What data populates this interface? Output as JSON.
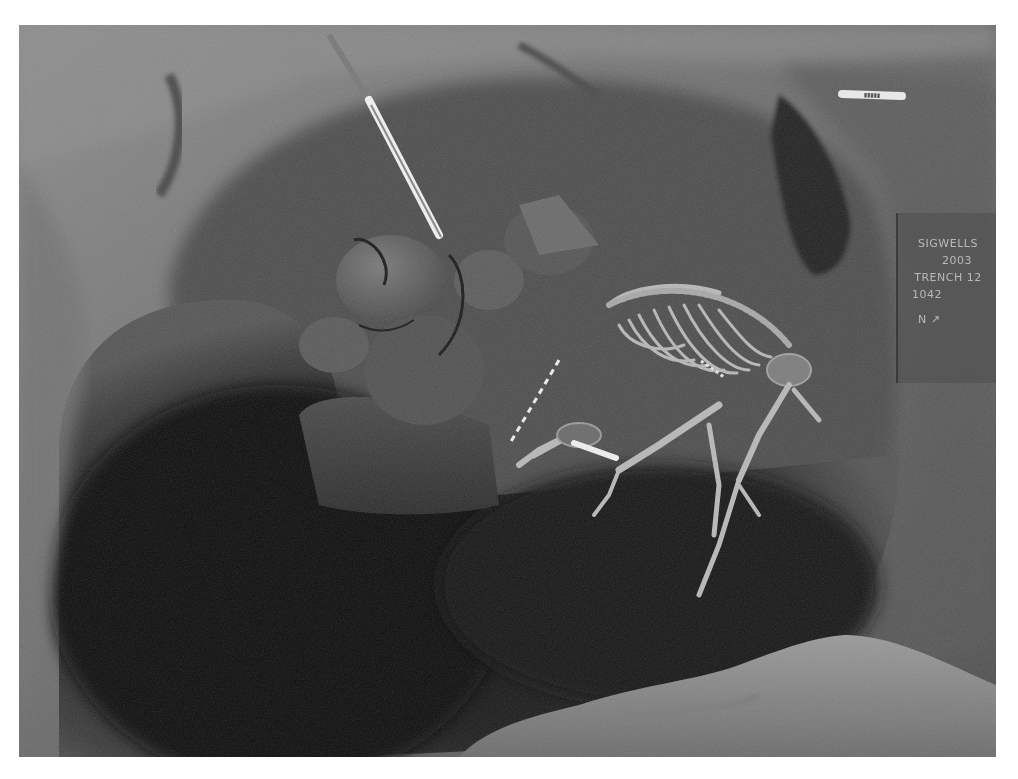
{
  "photo": {
    "subject": "excavated pit with animal skeleton",
    "colors": {
      "soil_light": "#8a8a8a",
      "soil_mid": "#5e5e5e",
      "pit_shadow": "#141414",
      "bone": "#bdbdbd",
      "scale_rod": "#f2f2f2"
    }
  },
  "label_board": {
    "lines": [
      "SIGWELLS",
      "2003",
      "TRENCH 12",
      "1042",
      "N ↗"
    ]
  },
  "scale_tag": {
    "text": "▮▮▮▮▮"
  }
}
